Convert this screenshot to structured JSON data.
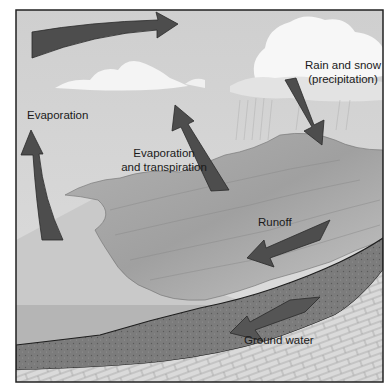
{
  "diagram": {
    "type": "water-cycle",
    "colors": {
      "sky": "#d4d4d4",
      "cloud": "#f7f7f7",
      "arrow": "#4a4a4a",
      "arrow_edge": "#2a2a2a",
      "sea": "#bdbdbd",
      "land": "#a8a8a8",
      "soil": "#7a7a7a",
      "bedrock": "#d9d9d9",
      "frame": "#222222"
    },
    "labels": {
      "evaporation": "Evaporation",
      "evap_transp_line1": "Evaporation",
      "evap_transp_line2": "and transpiration",
      "precip_line1": "Rain and snow",
      "precip_line2": "(precipitation)",
      "runoff": "Runoff",
      "ground_water": "Ground water"
    },
    "arrows": [
      {
        "name": "atmospheric-transport",
        "direction": "right"
      },
      {
        "name": "evaporation",
        "direction": "up"
      },
      {
        "name": "evaporation-transpiration",
        "direction": "up-left"
      },
      {
        "name": "precipitation",
        "direction": "down-right"
      },
      {
        "name": "runoff",
        "direction": "down-left"
      },
      {
        "name": "ground-water",
        "direction": "left"
      }
    ]
  }
}
